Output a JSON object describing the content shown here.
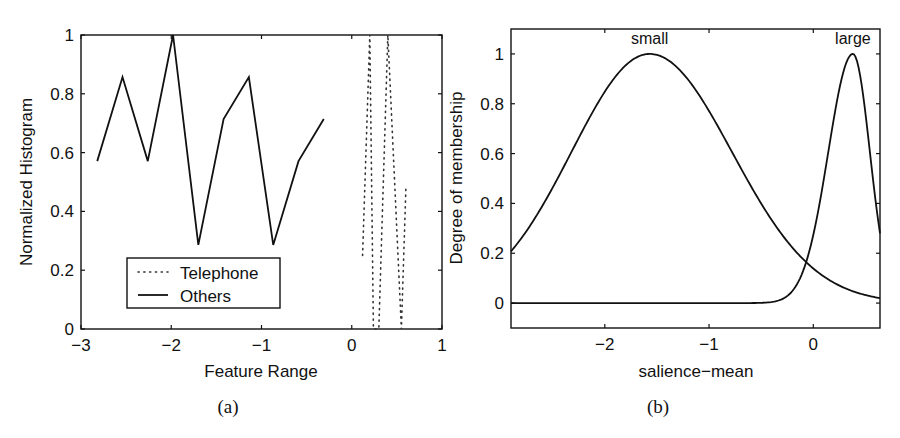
{
  "chart_data": [
    {
      "id": "a",
      "type": "line",
      "caption": "(a)",
      "title": "",
      "xlabel": "Feature Range",
      "ylabel": "Normalized Histogram",
      "xlim": [
        -3,
        1
      ],
      "ylim": [
        0,
        1
      ],
      "xticks": [
        -3,
        -2,
        -1,
        0,
        1
      ],
      "xtick_labels": [
        "−3",
        "−2",
        "−1",
        "0",
        "1"
      ],
      "yticks": [
        0,
        0.2,
        0.4,
        0.6,
        0.8,
        1
      ],
      "ytick_labels": [
        "0",
        "0.2",
        "0.4",
        "0.6",
        "0.8",
        "1"
      ],
      "grid": false,
      "legend": {
        "position": "lower-left-inside",
        "entries": [
          "Telephone",
          "Others"
        ]
      },
      "series": [
        {
          "name": "Telephone",
          "style": "dotted",
          "x": [
            0.12,
            0.2,
            0.24,
            0.3,
            0.4,
            0.55,
            0.6
          ],
          "y": [
            0.25,
            1.0,
            0.0,
            0.0,
            1.0,
            0.0,
            0.48
          ]
        },
        {
          "name": "Others",
          "style": "solid",
          "x": [
            -2.82,
            -2.54,
            -2.26,
            -1.98,
            -1.7,
            -1.42,
            -1.14,
            -0.87,
            -0.59,
            -0.31
          ],
          "y": [
            0.571,
            0.857,
            0.571,
            1.0,
            0.286,
            0.714,
            0.857,
            0.286,
            0.571,
            0.714
          ]
        }
      ]
    },
    {
      "id": "b",
      "type": "line",
      "caption": "(b)",
      "title": "",
      "xlabel": "salience−mean",
      "ylabel": "Degree of membership",
      "xlim": [
        -2.9,
        0.64
      ],
      "ylim": [
        -0.1,
        1.1
      ],
      "xticks": [
        -2,
        -1,
        0
      ],
      "xtick_labels": [
        "−2",
        "−1",
        "0"
      ],
      "yticks": [
        0,
        0.2,
        0.4,
        0.6,
        0.8,
        1
      ],
      "ytick_labels": [
        "0",
        "0.2",
        "0.4",
        "0.6",
        "0.8",
        "1"
      ],
      "grid": false,
      "annotations": [
        {
          "text": "small",
          "x": -1.57,
          "y": 1.05
        },
        {
          "text": "large",
          "x": 0.38,
          "y": 1.05
        }
      ],
      "series": [
        {
          "name": "small",
          "style": "solid",
          "shape": "gaussian",
          "center": -1.57,
          "sigma_left": 0.75,
          "sigma_right": 0.79,
          "x": [
            -2.9,
            -2.5,
            -2.0,
            -1.57,
            -1.0,
            -0.5,
            0.0,
            0.04,
            0.3,
            0.64
          ],
          "y": [
            0.28,
            0.52,
            0.86,
            1.0,
            0.77,
            0.39,
            0.14,
            0.125,
            0.06,
            0.025
          ]
        },
        {
          "name": "large",
          "style": "solid",
          "shape": "asym-gaussian",
          "center": 0.38,
          "sigma_left": 0.165,
          "sigma_right": 0.163,
          "x": [
            -2.9,
            -0.3,
            -0.15,
            0.0,
            0.04,
            0.2,
            0.38,
            0.5,
            0.64
          ],
          "y": [
            0.0,
            0.0,
            0.005,
            0.07,
            0.125,
            0.55,
            1.0,
            0.76,
            0.28
          ]
        }
      ]
    }
  ]
}
